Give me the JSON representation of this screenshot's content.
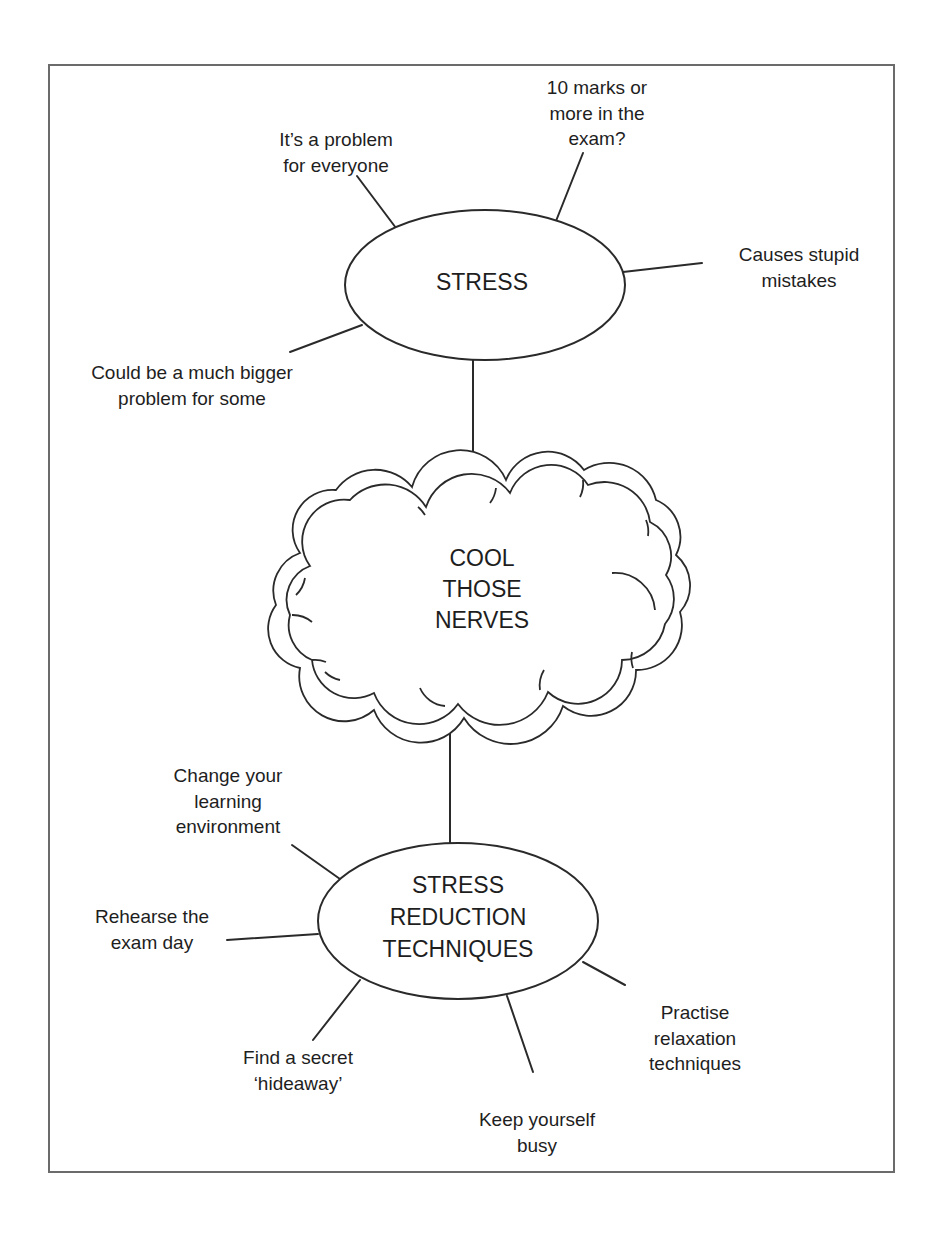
{
  "diagram": {
    "type": "mind-map",
    "colors": {
      "line": "#2a2a2a",
      "text": "#1e1e1e",
      "frame": "#6b6b6b",
      "background": "#ffffff"
    },
    "top_node": {
      "label": "STRESS",
      "branches": [
        {
          "id": "problem-everyone",
          "lines": [
            "It’s a problem",
            "for everyone"
          ]
        },
        {
          "id": "ten-marks",
          "lines": [
            "10 marks or",
            "more in the",
            "exam?"
          ]
        },
        {
          "id": "stupid-mistakes",
          "lines": [
            "Causes stupid",
            "mistakes"
          ]
        },
        {
          "id": "bigger-problem",
          "lines": [
            "Could be a much bigger",
            "problem for some"
          ]
        }
      ]
    },
    "center_node": {
      "lines": [
        "COOL",
        "THOSE",
        "NERVES"
      ]
    },
    "bottom_node": {
      "lines": [
        "STRESS",
        "REDUCTION",
        "TECHNIQUES"
      ],
      "branches": [
        {
          "id": "learning-environment",
          "lines": [
            "Change your",
            "learning",
            "environment"
          ]
        },
        {
          "id": "rehearse-exam",
          "lines": [
            "Rehearse the",
            "exam day"
          ]
        },
        {
          "id": "secret-hideaway",
          "lines": [
            "Find a secret",
            "‘hideaway’"
          ]
        },
        {
          "id": "keep-busy",
          "lines": [
            "Keep yourself",
            "busy"
          ]
        },
        {
          "id": "relaxation",
          "lines": [
            "Practise",
            "relaxation",
            "techniques"
          ]
        }
      ]
    }
  }
}
